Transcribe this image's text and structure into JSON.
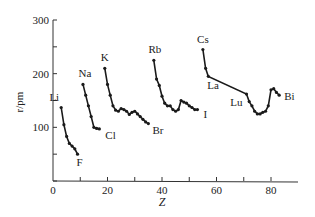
{
  "chart_data": {
    "type": "line",
    "title": "",
    "xlabel": "Z",
    "ylabel": "r/pm",
    "xlim": [
      0,
      90
    ],
    "ylim": [
      0,
      300
    ],
    "x_ticks": [
      0,
      10,
      20,
      30,
      40,
      50,
      60,
      70,
      80
    ],
    "x_tick_labels": [
      "0",
      "20",
      "40",
      "60",
      "80"
    ],
    "y_ticks": [
      0,
      50,
      100,
      150,
      200,
      250,
      300
    ],
    "y_tick_labels": [
      "100",
      "200",
      "300"
    ],
    "grid": false,
    "legend": false,
    "line_color": "#1a1a1a",
    "series": [
      {
        "name": "Period 2",
        "start_label": "Li",
        "end_label": "F",
        "x": [
          3,
          4,
          5,
          6,
          7,
          8,
          9
        ],
        "y": [
          137,
          105,
          83,
          70,
          65,
          60,
          50
        ]
      },
      {
        "name": "Period 3",
        "start_label": "Na",
        "end_label": "Cl",
        "x": [
          11,
          12,
          13,
          14,
          15,
          16,
          17
        ],
        "y": [
          180,
          160,
          140,
          120,
          100,
          98,
          97
        ]
      },
      {
        "name": "Period 4",
        "start_label": "K",
        "end_label": "Br",
        "x": [
          19,
          20,
          21,
          22,
          23,
          24,
          25,
          26,
          27,
          28,
          29,
          30,
          31,
          32,
          33,
          34,
          35
        ],
        "y": [
          210,
          180,
          160,
          140,
          132,
          130,
          135,
          133,
          130,
          124,
          128,
          130,
          125,
          120,
          115,
          110,
          107
        ]
      },
      {
        "name": "Period 5",
        "start_label": "Rb",
        "end_label": "I",
        "x": [
          37,
          38,
          39,
          40,
          41,
          42,
          43,
          44,
          45,
          46,
          47,
          48,
          49,
          50,
          51,
          52,
          53
        ],
        "y": [
          225,
          190,
          178,
          158,
          145,
          140,
          140,
          133,
          130,
          133,
          150,
          147,
          145,
          140,
          137,
          133,
          133
        ]
      },
      {
        "name": "Period 6",
        "start_label": "Cs",
        "end_label": "Bi",
        "x": [
          55,
          56,
          57,
          71,
          72,
          73,
          74,
          75,
          76,
          77,
          78,
          79,
          80,
          81,
          82,
          83
        ],
        "y": [
          245,
          210,
          195,
          162,
          148,
          140,
          130,
          125,
          125,
          128,
          130,
          140,
          170,
          172,
          165,
          160
        ]
      }
    ],
    "annotations": [
      {
        "text": "Li",
        "x": 3,
        "y": 137
      },
      {
        "text": "F",
        "x": 9,
        "y": 50
      },
      {
        "text": "Na",
        "x": 11,
        "y": 180
      },
      {
        "text": "Cl",
        "x": 17,
        "y": 97
      },
      {
        "text": "K",
        "x": 19,
        "y": 210
      },
      {
        "text": "Br",
        "x": 35,
        "y": 107
      },
      {
        "text": "Rb",
        "x": 37,
        "y": 225
      },
      {
        "text": "I",
        "x": 53,
        "y": 133
      },
      {
        "text": "Cs",
        "x": 55,
        "y": 245
      },
      {
        "text": "La",
        "x": 57,
        "y": 195
      },
      {
        "text": "Lu",
        "x": 71,
        "y": 162
      },
      {
        "text": "Bi",
        "x": 83,
        "y": 160
      }
    ]
  }
}
